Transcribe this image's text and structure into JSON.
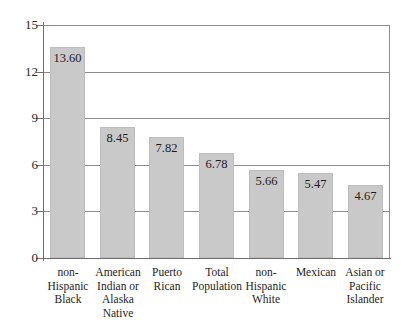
{
  "chart_data": {
    "type": "bar",
    "title": "",
    "subtitle": "",
    "xlabel": "",
    "ylabel": "",
    "ylim": [
      0,
      15
    ],
    "yticks": [
      0,
      3,
      6,
      9,
      12,
      15
    ],
    "ytick_labels": [
      "0",
      "3",
      "6",
      "9",
      "12",
      "15"
    ],
    "grid": "horizontal",
    "legend": "none",
    "bar_color": "#c9c9c9",
    "axis_color": "#6f6f6f",
    "gridline_color": "#8d8d8d",
    "categories": [
      "non-Hispanic Black",
      "American Indian or Alaska Native",
      "Puerto Rican",
      "Total Population",
      "non-Hispanic White",
      "Mexican",
      "Asian or Pacific Islander"
    ],
    "category_lines": [
      [
        "non-",
        "Hispanic",
        "Black"
      ],
      [
        "American",
        "Indian or",
        "Alaska",
        "Native"
      ],
      [
        "Puerto",
        "Rican"
      ],
      [
        "Total",
        "Population"
      ],
      [
        "non-",
        "Hispanic",
        "White"
      ],
      [
        "Mexican"
      ],
      [
        "Asian or",
        "Pacific",
        "Islander"
      ]
    ],
    "values": [
      13.6,
      8.45,
      7.82,
      6.78,
      5.66,
      5.47,
      4.67
    ],
    "value_labels": [
      "13.60",
      "8.45",
      "7.82",
      "6.78",
      "5.66",
      "5.47",
      "4.67"
    ]
  }
}
